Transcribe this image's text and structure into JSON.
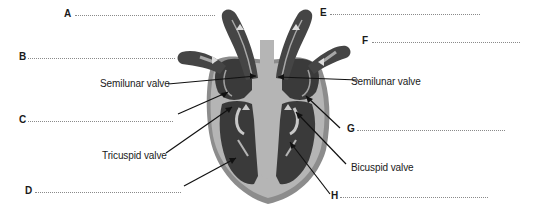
{
  "diagram": {
    "colors": {
      "chamber_dark": "#3a3a3a",
      "vessel_dark": "#454545",
      "wall_mid": "#8c8c8c",
      "septum_light": "#b5b5b5",
      "outline_light": "#d4d4d4",
      "arrow_fill": "#dcdcdc",
      "pointer_line": "#111111",
      "answer_dots": "#8a8a8a"
    },
    "blank_labels": [
      {
        "id": "A",
        "letter": "A",
        "line_x1": 75,
        "line_x2": 215,
        "y": 15
      },
      {
        "id": "B",
        "letter": "B",
        "line_x1": 28,
        "line_x2": 175,
        "y": 58
      },
      {
        "id": "C",
        "letter": "C",
        "line_x1": 28,
        "line_x2": 173,
        "y": 121
      },
      {
        "id": "D",
        "letter": "D",
        "line_x1": 35,
        "line_x2": 181,
        "y": 192
      },
      {
        "id": "E",
        "letter": "E",
        "line_x1": 330,
        "line_x2": 480,
        "y": 14
      },
      {
        "id": "F",
        "letter": "F",
        "line_x1": 372,
        "line_x2": 520,
        "y": 42
      },
      {
        "id": "G",
        "letter": "G",
        "line_x1": 357,
        "line_x2": 505,
        "y": 130
      },
      {
        "id": "H",
        "letter": "H",
        "line_x1": 340,
        "line_x2": 488,
        "y": 197
      }
    ],
    "valve_labels": [
      {
        "id": "semilunar-left",
        "text": "Semilunar valve"
      },
      {
        "id": "semilunar-right",
        "text": "Semilunar valve"
      },
      {
        "id": "tricuspid",
        "text": "Tricuspid valve"
      },
      {
        "id": "bicuspid",
        "text": "Bicuspid valve"
      }
    ]
  }
}
